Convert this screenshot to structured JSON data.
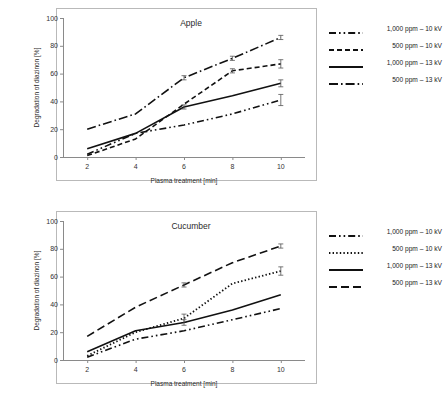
{
  "figures": [
    {
      "id": "apple",
      "title": "Apple",
      "xlabel": "Plasma treatment [min]",
      "ylabel": "Degradation of diazinon [%]",
      "xticks": [
        2,
        4,
        6,
        8,
        10
      ],
      "yticks": [
        0,
        20,
        40,
        60,
        80,
        100
      ],
      "legend": [
        {
          "label": "1,000 ppm – 10 kV",
          "style": "dashdotdot"
        },
        {
          "label": "500 ppm – 10 kV",
          "style": "dashed"
        },
        {
          "label": "1,000 ppm – 13 kV",
          "style": "solid"
        },
        {
          "label": "500 ppm – 13 kV",
          "style": "dashdot"
        }
      ]
    },
    {
      "id": "cucumber",
      "title": "Cucumber",
      "xlabel": "Plasma treatment [min]",
      "ylabel": "Degradation of diazinon [%]",
      "xticks": [
        2,
        4,
        6,
        8,
        10
      ],
      "yticks": [
        0,
        20,
        40,
        60,
        80,
        100
      ],
      "legend": [
        {
          "label": "1,000 ppm – 10 kV",
          "style": "dashdotdot"
        },
        {
          "label": "500 ppm – 10 kV",
          "style": "dotted"
        },
        {
          "label": "1,000 ppm – 13 kV",
          "style": "solid"
        },
        {
          "label": "500 ppm – 13 kV",
          "style": "longdashed"
        }
      ]
    }
  ],
  "chart_data": [
    {
      "type": "line",
      "title": "Apple",
      "xlabel": "Plasma treatment [min]",
      "ylabel": "Degradation of diazinon [%]",
      "x": [
        2,
        4,
        6,
        8,
        10
      ],
      "xlim": [
        1,
        11
      ],
      "ylim": [
        0,
        100
      ],
      "grid": false,
      "legend_position": "right",
      "series": [
        {
          "name": "1,000 ppm – 10 kV",
          "style": "dashdotdot",
          "values": [
            2,
            17,
            23,
            31,
            41
          ],
          "errors": [
            0,
            0,
            0,
            0,
            4
          ]
        },
        {
          "name": "500 ppm – 10 kV",
          "style": "dashed",
          "values": [
            1,
            13,
            38,
            62,
            67
          ],
          "errors": [
            0,
            0,
            0,
            1.5,
            3
          ]
        },
        {
          "name": "1,000 ppm – 13 kV",
          "style": "solid",
          "values": [
            6,
            17,
            36,
            44,
            53
          ],
          "errors": [
            0,
            0,
            1.5,
            0,
            2.5
          ]
        },
        {
          "name": "500 ppm – 13 kV",
          "style": "dashdot",
          "values": [
            20,
            31,
            57,
            71,
            86
          ],
          "errors": [
            0,
            0,
            1.5,
            1.5,
            1.5
          ]
        }
      ]
    },
    {
      "type": "line",
      "title": "Cucumber",
      "xlabel": "Plasma treatment [min]",
      "ylabel": "Degradation of diazinon [%]",
      "x": [
        2,
        4,
        6,
        8,
        10
      ],
      "xlim": [
        1,
        11
      ],
      "ylim": [
        0,
        100
      ],
      "grid": false,
      "legend_position": "right",
      "series": [
        {
          "name": "1,000 ppm – 10 kV",
          "style": "dashdotdot",
          "values": [
            2,
            15,
            21,
            29,
            37
          ],
          "errors": [
            0,
            0,
            0,
            0,
            0
          ]
        },
        {
          "name": "500 ppm – 10 kV",
          "style": "dotted",
          "values": [
            3,
            20,
            30,
            55,
            64
          ],
          "errors": [
            0,
            0,
            3,
            0,
            3
          ]
        },
        {
          "name": "1,000 ppm – 13 kV",
          "style": "solid",
          "values": [
            6,
            21,
            27,
            36,
            47
          ],
          "errors": [
            0,
            0,
            2,
            0,
            0
          ]
        },
        {
          "name": "500 ppm – 13 kV",
          "style": "longdashed",
          "values": [
            17,
            38,
            54,
            70,
            82
          ],
          "errors": [
            0,
            0,
            1.5,
            0,
            1.5
          ]
        }
      ]
    }
  ]
}
